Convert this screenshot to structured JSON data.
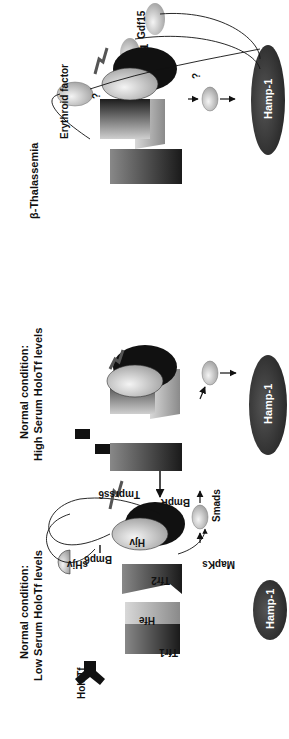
{
  "panels": [
    {
      "title_line1": "Normal condition:",
      "title_line2": "Low Serum HoloTf levels",
      "labels": {
        "holotf": "HoloTf",
        "tfr1": "Tfr1",
        "hfe": "Hfe",
        "tfr2": "Tfr2",
        "shjv": "sHjv",
        "bmp6": "Bmp6",
        "hjv": "Hjv",
        "bmpr": "BmpR",
        "tmprss6": "Tmprss6",
        "mapks": "MapKs",
        "smads": "Smads",
        "hamp": "Hamp-1"
      }
    },
    {
      "title_line1": "Normal condition:",
      "title_line2": "High Serum HoloTf levels",
      "labels": {
        "hamp": "Hamp-1"
      }
    },
    {
      "title_line1": "β-Thalassemia",
      "labels": {
        "erythroid": "Erythroid factor",
        "question1": "?",
        "question2": "?",
        "gdf15": "Gdf15",
        "twsg1": "Twsg1",
        "hamp": "Hamp-1"
      }
    }
  ],
  "colors": {
    "hamp_fill": "#3a3a3a",
    "receptor_dark": "#111111",
    "smad_fill": "#b0b0b0",
    "line": "#111111"
  }
}
